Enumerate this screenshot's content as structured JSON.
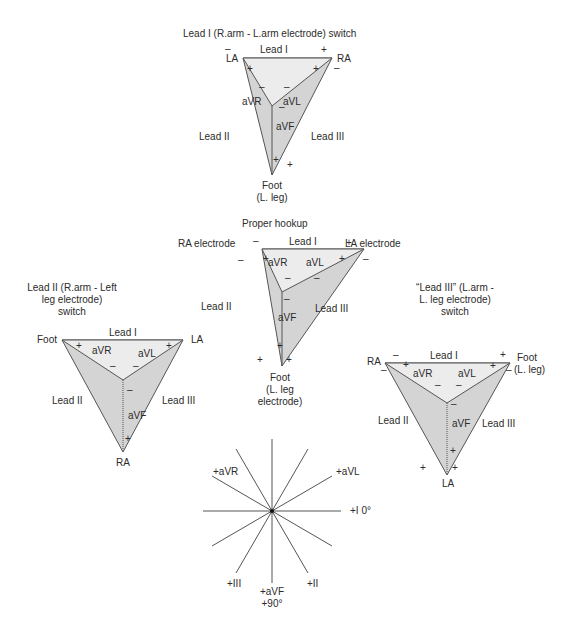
{
  "diagrams": {
    "top": {
      "title": "Lead I (R.arm - L.arm electrode) switch",
      "left_vertex": "LA",
      "right_vertex": "RA",
      "bottom_vertex": "Foot",
      "bottom_vertex_sub": "(L. leg)",
      "lead_i": "Lead I",
      "lead_ii": "Lead II",
      "lead_iii": "Lead III",
      "avr": "aVR",
      "avl": "aVL",
      "avf": "aVF"
    },
    "proper": {
      "title": "Proper hookup",
      "left_vertex": "RA electrode",
      "right_vertex": "LA electrode",
      "bottom_vertex": "Foot",
      "bottom_vertex_sub1": "(L. leg",
      "bottom_vertex_sub2": "electrode)",
      "lead_i": "Lead I",
      "lead_ii": "Lead II",
      "lead_iii": "Lead III",
      "avr": "aVR",
      "avl": "aVL",
      "avf": "aVF"
    },
    "left": {
      "title1": "Lead II (R.arm - Left",
      "title2": "leg electrode)",
      "title3": "switch",
      "left_vertex": "Foot",
      "right_vertex": "LA",
      "bottom_vertex": "RA",
      "lead_i": "Lead I",
      "lead_ii": "Lead II",
      "lead_iii": "Lead III",
      "avr": "aVR",
      "avl": "aVL",
      "avf": "aVF"
    },
    "right": {
      "title1": "“Lead III” (L.arm -",
      "title2": "L. leg electrode)",
      "title3": "switch",
      "left_vertex": "RA",
      "right_vertex": "Foot",
      "right_vertex_sub": "(L. leg)",
      "bottom_vertex": "LA",
      "lead_i": "Lead I",
      "lead_ii": "Lead II",
      "lead_iii": "Lead III",
      "avr": "aVR",
      "avl": "aVL",
      "avf": "aVF"
    },
    "hexaxial": {
      "avr": "+aVR",
      "avl": "+aVL",
      "lead_i": "+I 0°",
      "lead_iii": "+III",
      "avf": "+aVF",
      "avf_deg": "+90°",
      "lead_ii": "+II"
    }
  },
  "signs": {
    "plus": "+",
    "minus": "–"
  },
  "colors": {
    "outer_fill": "#d4d4d4",
    "inner_fill": "#ececec",
    "stroke": "#555555"
  }
}
